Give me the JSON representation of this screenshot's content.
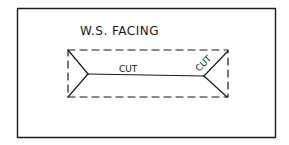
{
  "diagram": {
    "title": "W.S. FACING",
    "labels": {
      "center_cut": "CUT",
      "corner_cut": "CUT"
    },
    "legend_meaning": {
      "dashed_rectangle": "facing outline",
      "solid_lines": "cut lines"
    },
    "colors": {
      "ink": "#1a1a1a",
      "background": "#ffffff"
    }
  }
}
